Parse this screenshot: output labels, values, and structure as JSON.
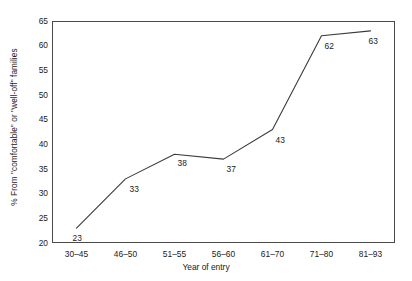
{
  "chart_data": {
    "type": "line",
    "title": "",
    "xlabel": "Year of entry",
    "ylabel": "% From \"comfortable\" or \"well-off\" families",
    "categories": [
      "30–45",
      "46–50",
      "51–55",
      "56–60",
      "61–70",
      "71–80",
      "81–93"
    ],
    "values": [
      23,
      33,
      38,
      37,
      43,
      62,
      63
    ],
    "point_labels": [
      "23",
      "33",
      "38",
      "37",
      "43",
      "62",
      "63"
    ],
    "ylim": [
      20,
      65
    ],
    "yticks": [
      20,
      25,
      30,
      35,
      40,
      45,
      50,
      55,
      60,
      65
    ],
    "ytick_labels": [
      "20",
      "25",
      "30",
      "35",
      "40",
      "45",
      "50",
      "55",
      "60",
      "65"
    ],
    "grid": false,
    "legend": false,
    "legend_position": "none",
    "line_color": "#3a3a3a",
    "frame_color": "#4a4a4a",
    "background_color": "#ffffff",
    "markers": false
  }
}
